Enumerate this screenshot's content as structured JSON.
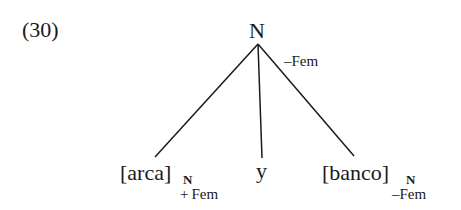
{
  "example_number": "(30)",
  "tree": {
    "root": {
      "label": "N",
      "feature": "–Fem"
    },
    "children": [
      {
        "label": "[arca]",
        "subscript": "N",
        "feature": "+ Fem"
      },
      {
        "label": "y"
      },
      {
        "label": "[banco]",
        "subscript": "N",
        "feature": "–Fem"
      }
    ]
  }
}
